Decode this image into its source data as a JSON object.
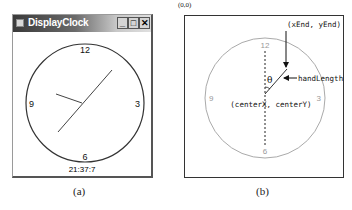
{
  "panel_a": {
    "window": {
      "title": "DisplayClock",
      "buttons": {
        "minimize": "_",
        "maximize": "□",
        "close": "✕"
      }
    },
    "clock": {
      "numbers": {
        "twelve": "12",
        "three": "3",
        "six": "6",
        "nine": "9"
      },
      "time_text": "21:37:7"
    },
    "caption": "(a)"
  },
  "panel_b": {
    "origin_label": "(0,0)",
    "numbers": {
      "twelve": "12",
      "three": "3",
      "six": "6",
      "nine": "9"
    },
    "end_label": "(xEnd, yEnd)",
    "hand_label": "handLength",
    "angle_label": "θ",
    "center_label": "(centerX, centerY)",
    "caption": "(b)"
  },
  "colors": {
    "clock_outline": "#333333",
    "diagram_circle": "#aaaaaa",
    "diagram_numbers": "#999999",
    "ink": "#111111"
  }
}
